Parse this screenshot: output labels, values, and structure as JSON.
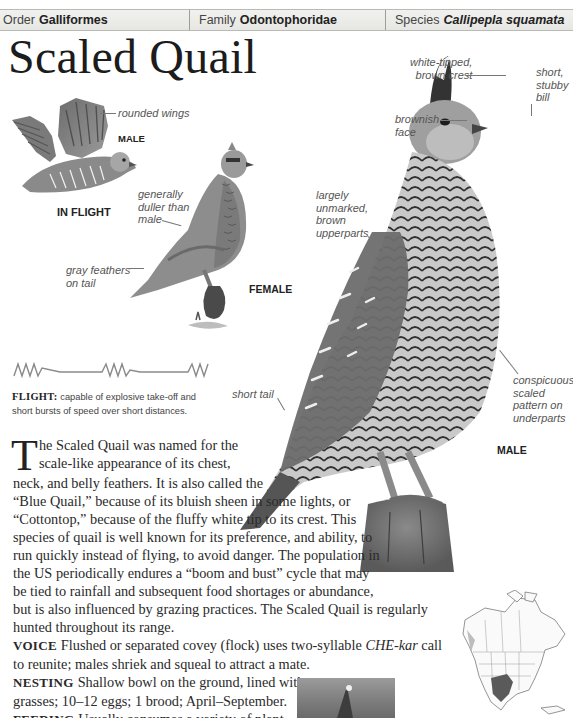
{
  "header": {
    "order_label": "Order",
    "order_value": "Galliformes",
    "family_label": "Family",
    "family_value": "Odontophoridae",
    "species_label": "Species",
    "species_value": "Callipepla squamata"
  },
  "title": "Scaled Quail",
  "illustrations": {
    "in_flight": {
      "caption": "IN FLIGHT",
      "sex": "MALE",
      "labels": [
        "rounded wings"
      ]
    },
    "female": {
      "sex": "FEMALE",
      "labels": [
        "generally duller than male",
        "gray feathers on tail"
      ],
      "label_lines": {
        "duller": [
          "generally",
          "duller than",
          "male"
        ],
        "tail": [
          "gray feathers",
          "on tail"
        ]
      }
    },
    "male": {
      "sex": "MALE",
      "label_lines": {
        "crest": [
          "white-tipped,",
          "brown crest"
        ],
        "bill": [
          "short,",
          "stubby",
          "bill"
        ],
        "face": [
          "brownish",
          "face"
        ],
        "upperparts": [
          "largely",
          "unmarked,",
          "brown",
          "upperparts"
        ],
        "tail": [
          "short tail"
        ],
        "underparts": [
          "conspicuous",
          "scaled",
          "pattern on",
          "underparts"
        ]
      }
    }
  },
  "flight": {
    "label": "FLIGHT:",
    "text_lines": [
      "capable of explosive take-off and",
      "short bursts of speed over short distances."
    ]
  },
  "description": {
    "dropcap": "T",
    "lines": [
      "he Scaled Quail was named for the",
      "scale-like appearance of its chest,",
      "neck, and belly feathers. It is also called the",
      "“Blue Quail,” because of its bluish sheen in some lights, or",
      "“Cottontop,” because of the fluffy white tip to its crest. This",
      "species of quail is well known for its preference, and ability, to",
      "run quickly instead of flying, to avoid danger. The population in",
      "the US periodically endures a “boom and bust” cycle that may",
      "be tied to rainfall and subsequent food shortages or abundance,",
      "but is also influenced by grazing practices. The Scaled Quail is regularly",
      "hunted throughout its range."
    ]
  },
  "sections": {
    "voice": {
      "label": "VOICE",
      "line1_pre": "Flushed or separated covey (flock) uses two-syllable ",
      "line1_italic": "CHE-kar",
      "line1_post": " call",
      "line2": "to reunite; males shriek and squeal to attract a mate."
    },
    "nesting": {
      "label": "NESTING",
      "line1": "Shallow bowl on the ground, lined with",
      "line2": "grasses; 10–12 eggs; 1 brood; April–September."
    },
    "feeding": {
      "label": "FEEDING",
      "line1": "Usually consumes a variety of plant",
      "line2": "seeds, but also eats leaves, insects, and grain when"
    }
  },
  "icons": {
    "flight_pattern": "zigzag-flight-pattern-icon",
    "range_map": "north-america-range-map"
  }
}
